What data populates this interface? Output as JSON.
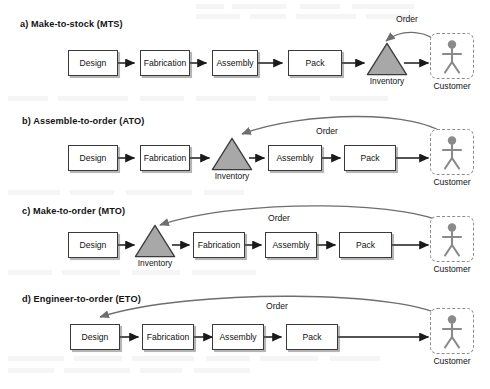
{
  "figure": {
    "background_color": "#ffffff",
    "box_fill": "#ffffff",
    "box_stroke": "#3a3a3a",
    "inventory_fill": "#a8a8a8",
    "inventory_stroke": "#3a3a3a",
    "customer_stroke": "#8c8c8c",
    "customer_figure_color": "#8a8a8a",
    "flow_arrow_color": "#1a1a1a",
    "order_arrow_color": "#6e6e6e",
    "text_color": "#141414"
  },
  "rows": [
    {
      "id": "mts",
      "title": "a) Make-to-stock (MTS)",
      "order_label": "Order",
      "inventory_label": "Inventory",
      "customer_label": "Customer",
      "stages": [
        "Design",
        "Fabrication",
        "Assembly",
        "Pack"
      ],
      "inventory_position": "after-pack",
      "order_target": "Inventory"
    },
    {
      "id": "ato",
      "title": "b) Assemble-to-order (ATO)",
      "order_label": "Order",
      "inventory_label": "Inventory",
      "customer_label": "Customer",
      "stages": [
        "Design",
        "Fabrication",
        "Assembly",
        "Pack"
      ],
      "inventory_position": "after-fabrication",
      "order_target": "Inventory"
    },
    {
      "id": "mto",
      "title": "c) Make-to-order (MTO)",
      "order_label": "Order",
      "inventory_label": "Inventory",
      "customer_label": "Customer",
      "stages": [
        "Design",
        "Fabrication",
        "Assembly",
        "Pack"
      ],
      "inventory_position": "after-design",
      "order_target": "Inventory"
    },
    {
      "id": "eto",
      "title": "d) Engineer-to-order (ETO)",
      "order_label": "Order",
      "inventory_label": "",
      "customer_label": "Customer",
      "stages": [
        "Design",
        "Fabrication",
        "Assembly",
        "Pack"
      ],
      "inventory_position": "none",
      "order_target": "Design"
    }
  ]
}
